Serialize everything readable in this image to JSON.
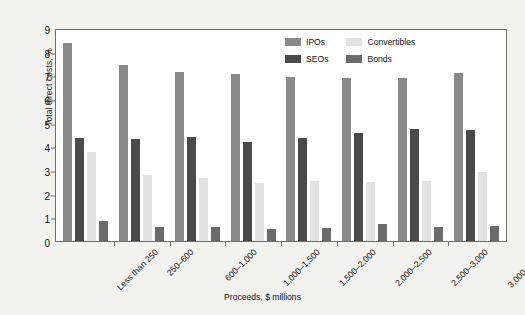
{
  "chart_data": {
    "type": "bar",
    "title": "",
    "xlabel": "Proceeds, $ millions",
    "ylabel": "Total direct costs, %",
    "ylim": [
      0,
      9
    ],
    "ytick_step": 1,
    "grid": false,
    "legend_position": "top-right",
    "categories": [
      "Less than 250",
      "250–600",
      "600–1,000",
      "1,000–1,500",
      "1,500–2,000",
      "2,000–2,500",
      "2,500–3,000",
      "3,000 and up"
    ],
    "yticks": [
      "0",
      "1",
      "2",
      "3",
      "4",
      "5",
      "6",
      "7",
      "8",
      "9"
    ],
    "series": [
      {
        "name": "IPOs",
        "color": "#8a8a8a",
        "values": [
          8.35,
          7.45,
          7.15,
          7.05,
          6.95,
          6.9,
          6.9,
          7.1
        ]
      },
      {
        "name": "SEOs",
        "color": "#4a4a4a",
        "values": [
          4.35,
          4.3,
          4.4,
          4.2,
          4.35,
          4.55,
          4.75,
          4.7
        ]
      },
      {
        "name": "Convertibles",
        "color": "#e2e2e2",
        "values": [
          3.75,
          2.8,
          2.65,
          2.45,
          2.55,
          2.5,
          2.55,
          2.9
        ]
      },
      {
        "name": "Bonds",
        "color": "#6b6b6b",
        "values": [
          0.85,
          0.6,
          0.6,
          0.5,
          0.55,
          0.7,
          0.6,
          0.65
        ]
      }
    ]
  },
  "legend": {
    "items": [
      {
        "label": "IPOs",
        "color": "#8a8a8a"
      },
      {
        "label": "Convertibles",
        "color": "#e2e2e2"
      },
      {
        "label": "SEOs",
        "color": "#4a4a4a"
      },
      {
        "label": "Bonds",
        "color": "#6b6b6b"
      }
    ]
  },
  "colors": {
    "background": "#f2f2ef",
    "plot_background": "#ffffff",
    "axis": "#6e6e6e",
    "text": "#111111"
  }
}
